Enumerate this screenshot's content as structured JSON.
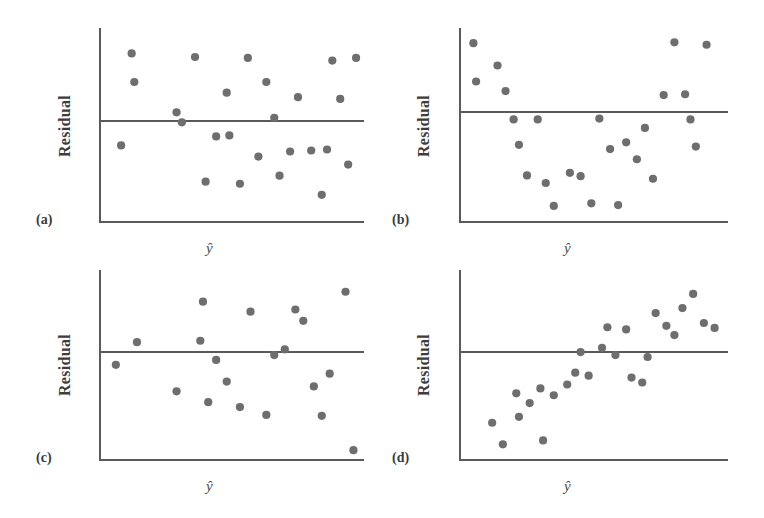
{
  "figure": {
    "background": "#ffffff",
    "point_color": "#6e6e6e",
    "axis_color": "#5a5a5a",
    "zero_line_color": "#5a5a5a",
    "label_color": "#3b3b3b",
    "width": 764,
    "height": 518
  },
  "labels": {
    "panel_a": "(a)",
    "panel_b": "(b)",
    "panel_c": "(c)",
    "panel_d": "(d)",
    "y_axis": "Residual",
    "x_axis": "ŷ"
  },
  "chart_data": [
    {
      "id": "panel-a",
      "type": "scatter",
      "title": "(a)",
      "xlabel": "ŷ",
      "ylabel": "Residual",
      "grid": false,
      "legend": null,
      "xlim": [
        0,
        100
      ],
      "ylim": [
        -100,
        100
      ],
      "zero_line": 0,
      "pattern": "random scatter — no pattern, constant variance",
      "x": [
        8,
        12,
        13,
        29,
        31,
        36,
        40,
        44,
        48,
        49,
        53,
        56,
        60,
        63,
        66,
        68,
        72,
        75,
        80,
        84,
        86,
        88,
        91,
        94,
        97
      ],
      "y": [
        -24,
        76,
        44,
        10,
        -1,
        72,
        -60,
        -15,
        32,
        -14,
        -62,
        71,
        -35,
        44,
        4,
        -54,
        -30,
        27,
        -29,
        -73,
        -28,
        68,
        25,
        -43,
        71
      ]
    },
    {
      "id": "panel-b",
      "type": "scatter",
      "title": "(b)",
      "xlabel": "ŷ",
      "ylabel": "Residual",
      "grid": false,
      "legend": null,
      "xlim": [
        0,
        100
      ],
      "ylim": [
        -130,
        100
      ],
      "zero_line": 0,
      "pattern": "curved (bowl) pattern — nonlinearity present",
      "x": [
        5,
        6,
        14,
        17,
        20,
        22,
        25,
        29,
        32,
        35,
        41,
        45,
        49,
        52,
        56,
        59,
        62,
        66,
        69,
        72,
        76,
        80,
        84,
        86,
        88,
        92
      ],
      "y": [
        86,
        38,
        58,
        26,
        -9,
        -39,
        -75,
        -9,
        -84,
        -111,
        -72,
        -76,
        -108,
        -8,
        -44,
        -110,
        -36,
        -56,
        -19,
        -79,
        21,
        87,
        22,
        -9,
        -41,
        84
      ]
    },
    {
      "id": "panel-c",
      "type": "scatter",
      "title": "(c)",
      "xlabel": "ŷ",
      "ylabel": "Residual",
      "grid": false,
      "legend": null,
      "xlim": [
        0,
        100
      ],
      "ylim": [
        -110,
        110
      ],
      "zero_line": 0,
      "pattern": "increasing spread (fanning out) — non-constant variance",
      "x": [
        6,
        14,
        29,
        38,
        39,
        41,
        44,
        48,
        53,
        57,
        63,
        66,
        70,
        74,
        77,
        81,
        84,
        87,
        93,
        96
      ],
      "y": [
        -13,
        14,
        -40,
        16,
        71,
        -51,
        -8,
        -30,
        -56,
        57,
        -64,
        -3,
        4,
        60,
        44,
        -35,
        -65,
        -22,
        85,
        -100
      ]
    },
    {
      "id": "panel-d",
      "type": "scatter",
      "title": "(d)",
      "xlabel": "ŷ",
      "ylabel": "Residual",
      "grid": false,
      "legend": null,
      "xlim": [
        0,
        100
      ],
      "ylim": [
        -110,
        110
      ],
      "zero_line": 0,
      "pattern": "increasing trend — residuals rise with fitted value",
      "x": [
        12,
        16,
        21,
        22,
        26,
        30,
        31,
        35,
        40,
        43,
        45,
        48,
        53,
        55,
        58,
        62,
        64,
        68,
        70,
        73,
        77,
        80,
        83,
        87,
        91,
        95
      ],
      "y": [
        -72,
        -94,
        -42,
        -66,
        -52,
        -37,
        -90,
        -44,
        -33,
        -21,
        0,
        -24,
        6,
        35,
        -3,
        32,
        -26,
        -31,
        -5,
        55,
        37,
        24,
        62,
        82,
        41,
        34
      ]
    }
  ]
}
